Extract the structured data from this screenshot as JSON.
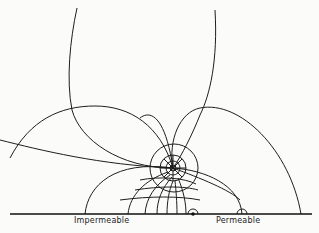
{
  "diagram": {
    "type": "flow-net",
    "labels": {
      "impermeable": "Impermeable",
      "permeable": "Permeable"
    },
    "stroke_color": "#1e1e1e",
    "background_color": "#fbfbfa"
  }
}
